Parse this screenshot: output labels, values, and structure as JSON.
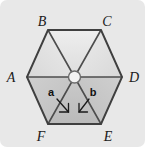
{
  "figure": {
    "kind": "hexagon-diagram",
    "shape_name": "regular-hexagon",
    "background_color": "#e8e8e8",
    "outline_color": "#4a4a4a",
    "center_hub_fill": "#f2f2f2",
    "vertices": [
      {
        "id": "A",
        "label": "A",
        "position": "left",
        "x": 27,
        "y": 77
      },
      {
        "id": "B",
        "label": "B",
        "position": "top-left",
        "x": 48,
        "y": 30
      },
      {
        "id": "C",
        "label": "C",
        "position": "top-right",
        "x": 101,
        "y": 30
      },
      {
        "id": "D",
        "label": "D",
        "position": "right",
        "x": 122,
        "y": 77
      },
      {
        "id": "E",
        "label": "E",
        "position": "bottom-right",
        "x": 101,
        "y": 124
      },
      {
        "id": "F",
        "label": "F",
        "position": "bottom-left",
        "x": 48,
        "y": 124
      }
    ],
    "vertex_labels": [
      {
        "text": "A",
        "x": 11,
        "y": 82,
        "anchor": "middle"
      },
      {
        "text": "B",
        "x": 42,
        "y": 26,
        "anchor": "middle"
      },
      {
        "text": "C",
        "x": 107,
        "y": 26,
        "anchor": "middle"
      },
      {
        "text": "D",
        "x": 134,
        "y": 82,
        "anchor": "middle"
      },
      {
        "text": "E",
        "x": 108,
        "y": 141,
        "anchor": "middle"
      },
      {
        "text": "F",
        "x": 41,
        "y": 141,
        "anchor": "middle"
      }
    ],
    "center": {
      "x": 74.5,
      "y": 77,
      "radius": 6
    },
    "angles": [
      {
        "id": "a",
        "label": "a",
        "label_x": 51,
        "label_y": 96,
        "between_rays": [
          "center-to-F",
          "center-to-E"
        ],
        "arrow_from": {
          "x": 57,
          "y": 99
        },
        "arrow_to": {
          "x": 68,
          "y": 112
        }
      },
      {
        "id": "b",
        "label": "b",
        "label_x": 93,
        "label_y": 96,
        "between_rays": [
          "center-to-F",
          "center-to-E"
        ],
        "arrow_from": {
          "x": 89,
          "y": 99
        },
        "arrow_to": {
          "x": 79,
          "y": 112
        }
      }
    ],
    "triangles": [
      {
        "id": "center-A-B",
        "fill": "#e4e4e4"
      },
      {
        "id": "center-B-C",
        "fill": "#e1e1e1"
      },
      {
        "id": "center-C-D",
        "fill": "#e4e4e4"
      },
      {
        "id": "center-D-E",
        "fill": "#c8c8c8"
      },
      {
        "id": "center-E-F",
        "fill": "#c2c2c2"
      },
      {
        "id": "center-F-A",
        "fill": "#c8c8c8"
      }
    ]
  }
}
